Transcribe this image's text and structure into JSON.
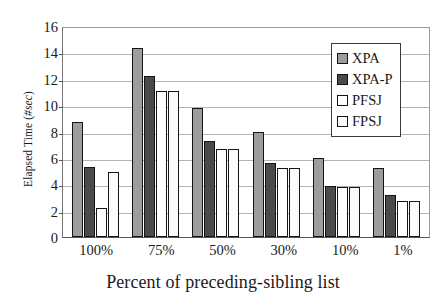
{
  "chart_data": {
    "type": "bar",
    "title": "",
    "xlabel": "Percent of preceding-sibling list",
    "ylabel": "Elapsed Time (#sec)",
    "ylabel_plain": "Elapsed Time (",
    "ylabel_italic": "#sec",
    "ylabel_tail": ")",
    "categories": [
      "100%",
      "75%",
      "50%",
      "30%",
      "10%",
      "1%"
    ],
    "series": [
      {
        "name": "XPA",
        "color": "#9d9d9d",
        "values": [
          8.7,
          14.3,
          9.8,
          8.0,
          6.0,
          5.2
        ]
      },
      {
        "name": "XPA-P",
        "color": "#4a4a4a",
        "values": [
          5.3,
          12.2,
          7.3,
          5.6,
          3.9,
          3.2
        ]
      },
      {
        "name": "PFSJ",
        "color": "#ffffff",
        "values": [
          2.2,
          11.1,
          6.7,
          5.2,
          3.8,
          2.7
        ]
      },
      {
        "name": "FPSJ",
        "color": "#fbfbfb",
        "values": [
          4.9,
          11.1,
          6.7,
          5.2,
          3.8,
          2.7
        ]
      }
    ],
    "ylim": [
      0,
      16
    ],
    "yticks": [
      0,
      2,
      4,
      6,
      8,
      10,
      12,
      14,
      16
    ],
    "ytick_labels": [
      "0",
      "2",
      "4",
      "6",
      "8",
      "10",
      "12",
      "14",
      "16"
    ],
    "grid": true,
    "grid_axis": "y",
    "legend_position": "top-right",
    "legend_entries": [
      "XPA",
      "XPA-P",
      "PFSJ",
      "FPSJ"
    ]
  }
}
